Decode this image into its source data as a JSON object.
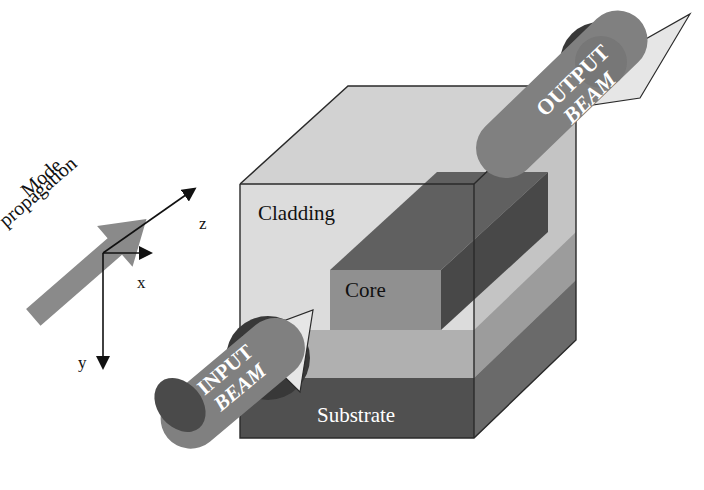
{
  "figure": {
    "background": "#ffffff"
  },
  "labels": {
    "cladding": "Cladding",
    "core": "Core",
    "substrate": "Substrate",
    "mode_line1": "Mode",
    "mode_line2": "propagation",
    "input_beam_line1": "INPUT",
    "input_beam_line2": "BEAM",
    "output_beam_line1": "OUTPUT",
    "output_beam_line2": "BEAM"
  },
  "axes": {
    "x_label": "x",
    "y_label": "y",
    "z_label": "z"
  },
  "colors": {
    "cladding_front": "#dcdcdc",
    "cladding_top": "#d2d2d2",
    "cladding_right": "#c4c4c4",
    "cladding_band": "#b0b0b0",
    "substrate_front": "#505050",
    "substrate_right": "#6a6a6a",
    "core_top": "#606060",
    "core_side": "#484848",
    "core_end": "#909090",
    "beam_body": "#808080",
    "beam_cap": "#383838",
    "mode_arrow": "#8a8a8a",
    "outline": "#2a2a2a",
    "text_dark": "#111111",
    "text_light": "#ffffff"
  }
}
